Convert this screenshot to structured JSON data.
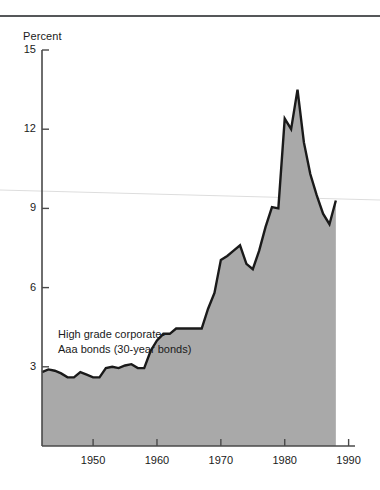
{
  "chart_data": {
    "type": "area",
    "title": "",
    "subtitle": "",
    "ylabel": "Percent",
    "xlabel": "",
    "ylim": [
      0,
      15
    ],
    "xlim": [
      1942,
      1991
    ],
    "grid": false,
    "legend": "none",
    "annotations": [
      {
        "name": "series-label",
        "lines": [
          "High grade corporate-",
          "Aaa bonds (30-year bonds)"
        ],
        "x": 1948,
        "y": 5.6
      }
    ],
    "yticks": [
      15,
      12,
      9,
      6,
      3
    ],
    "ytick_labels": [
      "15",
      "12",
      "9",
      "6",
      "3"
    ],
    "xticks": [
      1950,
      1960,
      1970,
      1980,
      1990
    ],
    "xtick_labels": [
      "1950",
      "1960",
      "1970",
      "1980",
      "1990"
    ],
    "series": [
      {
        "name": "High grade corporate-Aaa bonds (30-year bonds)",
        "fill_color": "#a9a9a9",
        "line_color": "#1a1a1a",
        "x": [
          1942,
          1943,
          1944,
          1945,
          1946,
          1947,
          1948,
          1949,
          1950,
          1951,
          1952,
          1953,
          1954,
          1955,
          1956,
          1957,
          1958,
          1959,
          1960,
          1961,
          1962,
          1963,
          1964,
          1965,
          1966,
          1967,
          1968,
          1969,
          1970,
          1971,
          1972,
          1973,
          1974,
          1975,
          1976,
          1977,
          1978,
          1979,
          1980,
          1981,
          1982,
          1983,
          1984,
          1985,
          1986,
          1987,
          1988
        ],
        "values": [
          2.8,
          2.9,
          2.85,
          2.75,
          2.6,
          2.6,
          2.8,
          2.7,
          2.6,
          2.6,
          2.95,
          3.0,
          2.95,
          3.05,
          3.1,
          2.95,
          2.95,
          3.6,
          4.0,
          4.25,
          4.25,
          4.45,
          4.45,
          4.45,
          4.45,
          4.45,
          5.2,
          5.8,
          7.05,
          7.2,
          7.4,
          7.6,
          6.9,
          6.7,
          7.4,
          8.3,
          9.05,
          9.0,
          12.4,
          12.0,
          13.5,
          11.5,
          10.3,
          9.5,
          8.8,
          8.4,
          9.3
        ]
      }
    ]
  },
  "figure": {
    "percent_label": "Percent"
  }
}
